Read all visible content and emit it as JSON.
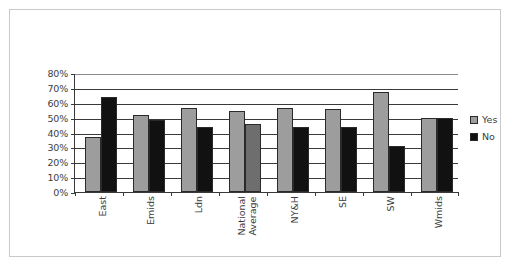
{
  "chart_data": {
    "type": "bar",
    "title": "",
    "subtitle": "",
    "xlabel": "",
    "ylabel": "",
    "ylim": [
      0,
      80
    ],
    "ytick_labels": [
      "80%",
      "70%",
      "60%",
      "50%",
      "40%",
      "30%",
      "20%",
      "10%",
      "0%"
    ],
    "ytick_values": [
      80,
      70,
      60,
      50,
      40,
      30,
      20,
      10,
      0
    ],
    "grid": true,
    "legend_position": "right",
    "categories": [
      "East",
      "Emids",
      "Ldn",
      "National Average",
      "NY&H",
      "SE",
      "SW",
      "Wmids"
    ],
    "category_lines": [
      [
        "East"
      ],
      [
        "Emids"
      ],
      [
        "Ldn"
      ],
      [
        "National",
        "Average"
      ],
      [
        "NY&H"
      ],
      [
        "SE"
      ],
      [
        "SW"
      ],
      [
        "Wmids"
      ]
    ],
    "series": [
      {
        "name": "Yes",
        "color": "#9d9d9d",
        "values": [
          37,
          52,
          56.5,
          54.5,
          56.5,
          55.5,
          67.5,
          49.5
        ]
      },
      {
        "name": "No",
        "color": "#111111",
        "values": [
          64,
          48.5,
          43.5,
          45.5,
          43.5,
          44,
          31,
          49.5
        ]
      }
    ]
  },
  "legend": {
    "items": [
      {
        "label": "Yes",
        "color": "#9d9d9d"
      },
      {
        "label": "No",
        "color": "#111111"
      }
    ]
  },
  "colors": {
    "yes": "#9d9d9d",
    "no": "#111111",
    "axis": "#3a3a3a",
    "frame": "#c9c9c9",
    "text": "#3d3d3d",
    "background": "#ffffff"
  }
}
